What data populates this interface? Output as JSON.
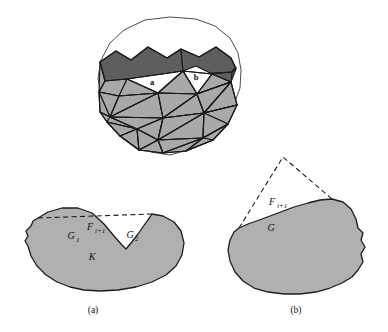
{
  "figure": {
    "background_color": "#ffffff",
    "colors": {
      "mesh_light": "#a9a9a9",
      "mesh_dark": "#5e5e5e",
      "mesh_white": "#ffffff",
      "blob_fill": "#b0b0b0",
      "stroke": "#1a1a1a",
      "dashed_stroke": "#1c1c1c"
    }
  },
  "panel_top": {
    "name": "triangulated-disc",
    "labels": {
      "triangle_a": "a",
      "triangle_b": "b"
    }
  },
  "panel_a": {
    "caption": "(a)",
    "labels": {
      "front": "F",
      "front_sub": "i+1",
      "gap_left": "G",
      "gap_left_sub": "1",
      "gap_right": "G",
      "gap_right_sub": "2",
      "vertex": "K"
    }
  },
  "panel_b": {
    "caption": "(b)",
    "labels": {
      "front": "F",
      "front_sub": "i+1",
      "gap": "G"
    }
  }
}
